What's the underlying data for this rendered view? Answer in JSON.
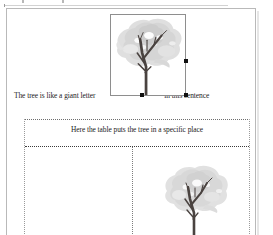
{
  "window": {
    "app_type": "word-processor-document",
    "ruler_visible": true
  },
  "document": {
    "paragraph": {
      "text_before_image": "The tree is like a giant letter",
      "text_after_image": "in this sentence"
    },
    "inline_image": {
      "name": "tree-picture",
      "alt": "tree-illustration",
      "selected": true,
      "handles": [
        "right-middle",
        "bottom-center",
        "bottom-right"
      ],
      "foliage_color": "#d8d8d8",
      "trunk_color": "#4a4340"
    },
    "table": {
      "caption": "Here the table puts the tree in a specific place",
      "rows": [
        {
          "cells": [
            {
              "content": ""
            },
            {
              "content": "tree-picture"
            }
          ]
        }
      ],
      "border_style": "dotted",
      "border_color": "#7d7d7d"
    }
  },
  "colors": {
    "page_background": "#ffffff",
    "page_border": "#b9b9b9",
    "text": "#1b1b1b",
    "handle": "#111111",
    "shadow": "#e6e6e6"
  }
}
